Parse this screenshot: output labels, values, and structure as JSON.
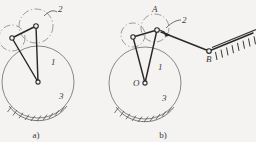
{
  "figure": {
    "background_color": "#f4f3f1",
    "ink_color": "#3a3734",
    "link_color": "#2c2a28",
    "dashed_color": "#8d8984"
  },
  "panels": [
    {
      "id": "a",
      "caption": "a)",
      "labels": {
        "link_1": "1",
        "roller_2": "2",
        "cam_3": "3"
      },
      "circles": {
        "ground_cam": {
          "cx": 38,
          "cy": 82,
          "r": 36
        },
        "roller_upper": {
          "cx": 36,
          "cy": 26,
          "r": 17
        },
        "roller_left": {
          "cx": 12,
          "cy": 38,
          "r": 13
        }
      },
      "joints": [
        {
          "name": "center-joint",
          "x": 38,
          "y": 82
        },
        {
          "name": "upper-joint",
          "x": 36,
          "y": 26
        },
        {
          "name": "left-joint",
          "x": 12,
          "y": 38
        }
      ],
      "leader_label_2": {
        "text": "2",
        "x": 58,
        "y": 11
      },
      "hatching": {
        "from_deg": 108,
        "to_deg": 72,
        "ticks": 11
      }
    },
    {
      "id": "b",
      "caption": "b)",
      "labels": {
        "link_1": "1",
        "roller_2": "2",
        "cam_3": "3",
        "center_O": "O",
        "point_A": "A",
        "point_B": "B"
      },
      "circles": {
        "ground_cam": {
          "cx": 145,
          "cy": 83,
          "r": 36
        },
        "roller_upper": {
          "cx": 155,
          "cy": 28,
          "r": 14
        },
        "roller_left": {
          "cx": 133,
          "cy": 35,
          "r": 12
        }
      },
      "joints": [
        {
          "name": "center-joint-O",
          "x": 145,
          "y": 83
        },
        {
          "name": "joint-A",
          "x": 157,
          "y": 30
        },
        {
          "name": "joint-left",
          "x": 133,
          "y": 37
        },
        {
          "name": "joint-B",
          "x": 209,
          "y": 51
        }
      ],
      "coupler": {
        "x1": 160,
        "y1": 31,
        "x2": 209,
        "y2": 51
      },
      "rocker": {
        "x1": 209,
        "y1": 51,
        "x2": 252,
        "y2": 34
      },
      "arrowhead_at": {
        "x": 164,
        "y": 33
      },
      "leader_label_2": {
        "text": "2",
        "x": 182,
        "y": 18
      },
      "hatching_cam": {
        "from_deg": 108,
        "to_deg": 72,
        "ticks": 11
      },
      "hatching_ground": {
        "x1": 213,
        "y1": 48,
        "x2": 252,
        "y2": 32,
        "ticks": 8
      }
    }
  ]
}
